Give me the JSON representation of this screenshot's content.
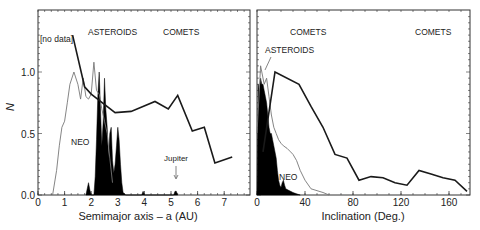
{
  "chart_data": [
    {
      "type": "line",
      "title": "",
      "xlabel": "Semimajor axis – a (AU)",
      "ylabel": "N",
      "xlim": [
        0,
        7.8
      ],
      "ylim": [
        0,
        1.5
      ],
      "xticks": [
        "0",
        "1",
        "2",
        "3",
        "4",
        "5",
        "6",
        "7"
      ],
      "yticks": [
        "0.0",
        "0.5",
        "1.0"
      ],
      "grid": false,
      "annotations": [
        {
          "text": "[no data]",
          "x": 0.1,
          "y": 1.34
        },
        {
          "text": "ASTEROIDS",
          "x": 1.9,
          "y": 1.35
        },
        {
          "text": "COMETS",
          "x": 4.8,
          "y": 1.35
        },
        {
          "text": "NEO",
          "x": 1.3,
          "y": 0.5
        },
        {
          "text": "Jupiter",
          "x": 5.2,
          "y": 0.28,
          "arrow_to": [
            5.2,
            0.05
          ]
        }
      ],
      "series": [
        {
          "name": "COMETS",
          "style": "thick-black-line",
          "x": [
            1.3,
            1.75,
            2.0,
            2.9,
            3.5,
            4.4,
            4.9,
            5.25,
            5.8,
            6.25,
            6.65,
            7.3
          ],
          "y": [
            1.3,
            0.88,
            0.82,
            0.67,
            0.68,
            0.76,
            0.7,
            0.81,
            0.52,
            0.55,
            0.26,
            0.31
          ]
        },
        {
          "name": "NEO",
          "style": "thin-gray-line",
          "x": [
            0.55,
            0.7,
            0.8,
            0.9,
            1.0,
            1.1,
            1.2,
            1.35,
            1.5,
            1.6,
            1.7,
            1.8,
            1.9,
            2.0,
            2.1,
            2.2,
            2.3,
            2.4,
            2.5,
            2.6,
            2.7,
            2.8
          ],
          "y": [
            0.0,
            0.2,
            0.4,
            0.55,
            0.6,
            0.75,
            0.9,
            1.0,
            0.9,
            0.78,
            0.95,
            0.8,
            0.78,
            0.82,
            1.08,
            0.85,
            0.82,
            0.7,
            0.6,
            0.5,
            0.3,
            0.1
          ]
        },
        {
          "name": "ASTEROIDS",
          "style": "black-filled-histogram",
          "x": [
            1.8,
            1.85,
            1.9,
            1.95,
            2.0,
            2.1,
            2.15,
            2.2,
            2.25,
            2.3,
            2.35,
            2.4,
            2.45,
            2.5,
            2.55,
            2.6,
            2.65,
            2.7,
            2.75,
            2.8,
            2.85,
            2.9,
            2.95,
            3.0,
            3.05,
            3.1,
            3.15,
            3.2,
            3.3,
            3.9,
            3.95,
            4.0,
            5.1,
            5.15,
            5.2,
            5.25
          ],
          "y": [
            0.0,
            0.05,
            0.1,
            0.04,
            0.0,
            0.0,
            0.15,
            0.45,
            0.8,
            1.0,
            0.7,
            0.4,
            0.6,
            0.95,
            0.7,
            0.55,
            0.3,
            0.5,
            0.55,
            0.28,
            0.18,
            0.25,
            0.4,
            0.55,
            0.45,
            0.25,
            0.1,
            0.02,
            0.0,
            0.0,
            0.03,
            0.0,
            0.0,
            0.03,
            0.03,
            0.0
          ]
        }
      ]
    },
    {
      "type": "line",
      "title": "",
      "xlabel": "Inclination (Deg.)",
      "ylabel": "",
      "xlim": [
        0,
        178
      ],
      "ylim": [
        0,
        1.5
      ],
      "xticks": [
        "0",
        "40",
        "80",
        "120",
        "160"
      ],
      "grid": false,
      "annotations": [
        {
          "text": "COMETS",
          "x": 25,
          "y": 1.35
        },
        {
          "text": "COMETS",
          "x": 132,
          "y": 1.35
        },
        {
          "text": "ASTEROIDS",
          "x": 8,
          "y": 1.2,
          "arrow_to": [
            7,
            1.0
          ]
        },
        {
          "text": "NEO",
          "x": 19,
          "y": 0.13
        }
      ],
      "series": [
        {
          "name": "COMETS",
          "style": "thick-black-line",
          "x": [
            5,
            15,
            35,
            45,
            55,
            65,
            75,
            85,
            95,
            105,
            115,
            125,
            135,
            145,
            155,
            165,
            175
          ],
          "y": [
            0.35,
            1.0,
            0.9,
            0.72,
            0.55,
            0.33,
            0.3,
            0.12,
            0.15,
            0.14,
            0.1,
            0.08,
            0.2,
            0.17,
            0.14,
            0.12,
            0.03
          ]
        },
        {
          "name": "NEO",
          "style": "thin-gray-line",
          "x": [
            0,
            3,
            6,
            8,
            10,
            12,
            14,
            16,
            18,
            20,
            22,
            25,
            28,
            30,
            33,
            36,
            40,
            45,
            55,
            60
          ],
          "y": [
            0.5,
            1.05,
            0.9,
            0.95,
            0.8,
            0.65,
            0.55,
            0.5,
            0.45,
            0.42,
            0.4,
            0.38,
            0.35,
            0.33,
            0.28,
            0.2,
            0.12,
            0.05,
            0.02,
            0.0
          ]
        },
        {
          "name": "ASTEROIDS",
          "style": "black-filled-histogram",
          "x": [
            0,
            1,
            2,
            3,
            4,
            5,
            6,
            7,
            8,
            9,
            10,
            11,
            12,
            13,
            14,
            15,
            16,
            17,
            18,
            19,
            20,
            21,
            22,
            23,
            24,
            26,
            28,
            30,
            33,
            36
          ],
          "y": [
            0.0,
            0.9,
            0.85,
            0.95,
            0.9,
            0.9,
            0.85,
            0.8,
            0.75,
            0.65,
            0.55,
            0.5,
            0.5,
            0.45,
            0.4,
            0.35,
            0.3,
            0.2,
            0.12,
            0.08,
            0.06,
            0.1,
            0.12,
            0.08,
            0.05,
            0.04,
            0.03,
            0.02,
            0.01,
            0.0
          ]
        }
      ]
    }
  ],
  "panels": {
    "left": {
      "ylabel": "N",
      "xlabel": "Semimajor axis – a (AU)",
      "labels": {
        "no_data": "[no data]",
        "asteroids": "ASTEROIDS",
        "comets": "COMETS",
        "neo": "NEO",
        "jupiter": "Jupiter"
      }
    },
    "right": {
      "xlabel": "Inclination (Deg.)",
      "labels": {
        "comets_1": "COMETS",
        "comets_2": "COMETS",
        "asteroids": "ASTEROIDS",
        "neo": "NEO"
      }
    }
  },
  "colors": {
    "comet_line": "#1a1a1a",
    "neo_line": "#777777",
    "asteroid_fill": "#000000",
    "axis": "#333333"
  }
}
